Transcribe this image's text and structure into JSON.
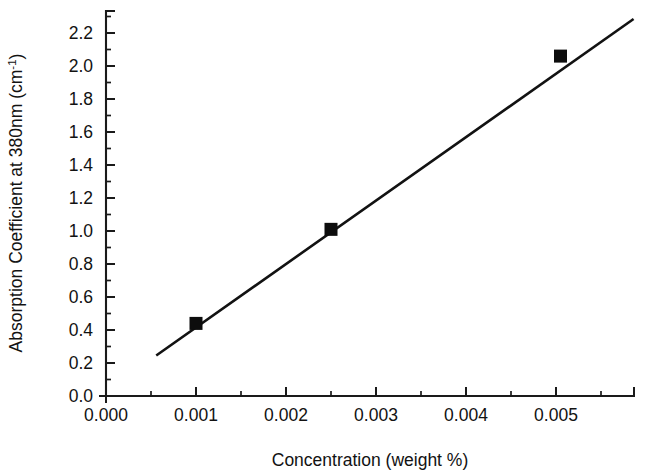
{
  "chart_data": {
    "type": "scatter",
    "title": "",
    "subtitle": "",
    "xlabel": "Concentration (weight %)",
    "ylabel_prefix": "Absorption Coefficient at 380nm (cm",
    "ylabel_sup": "-1",
    "ylabel_suffix": ")",
    "ylabel_full": "Absorption Coefficient at 380nm (cm-1)",
    "xlim": [
      0.0,
      0.00588
    ],
    "ylim": [
      0.0,
      2.32
    ],
    "xticks": [
      0.0,
      0.001,
      0.002,
      0.003,
      0.004,
      0.005
    ],
    "xticklabels": [
      "0.000",
      "0.001",
      "0.002",
      "0.003",
      "0.004",
      "0.005"
    ],
    "xminorticks": [
      0.0005,
      0.0015,
      0.0025,
      0.0035,
      0.0045,
      0.0055
    ],
    "yticks": [
      0.0,
      0.2,
      0.4,
      0.6,
      0.8,
      1.0,
      1.2,
      1.4,
      1.6,
      1.8,
      2.0,
      2.2
    ],
    "yticklabels": [
      "0.0",
      "0.2",
      "0.4",
      "0.6",
      "0.8",
      "1.0",
      "1.2",
      "1.4",
      "1.6",
      "1.8",
      "2.0",
      "2.2"
    ],
    "yminorticks": [
      0.1,
      0.3,
      0.5,
      0.7,
      0.9,
      1.1,
      1.3,
      1.5,
      1.7,
      1.9,
      2.1,
      2.3
    ],
    "grid": false,
    "legend": null,
    "marker_style": "filled-square",
    "marker_color": "#0d0d0d",
    "line_color": "#121212",
    "series": [
      {
        "name": "Absorption coefficient vs concentration",
        "x": [
          0.001,
          0.0025,
          0.00505
        ],
        "y": [
          0.44,
          1.01,
          2.06
        ]
      }
    ],
    "fit_line": {
      "x_start": 0.00057,
      "y_start": 0.25,
      "x_end": 0.00585,
      "y_end": 2.28
    },
    "annotations": []
  }
}
